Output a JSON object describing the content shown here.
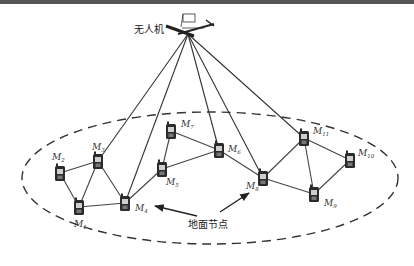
{
  "diagram": {
    "uav": {
      "label": "无人机",
      "x": 188,
      "y": 30
    },
    "ground_label": "地面节点",
    "region": {
      "cx": 210,
      "cy": 178,
      "rx": 188,
      "ry": 66
    },
    "nodes": [
      {
        "id": "M1",
        "sub": "1",
        "x": 79,
        "y": 207,
        "lx": 74,
        "ly": 227
      },
      {
        "id": "M2",
        "sub": "2",
        "x": 60,
        "y": 173,
        "lx": 52,
        "ly": 160
      },
      {
        "id": "M3",
        "sub": "3",
        "x": 98,
        "y": 161,
        "lx": 92,
        "ly": 150
      },
      {
        "id": "M4",
        "sub": "4",
        "x": 125,
        "y": 203,
        "lx": 135,
        "ly": 211
      },
      {
        "id": "M5",
        "sub": "5",
        "x": 162,
        "y": 169,
        "lx": 166,
        "ly": 185
      },
      {
        "id": "M6",
        "sub": "6",
        "x": 219,
        "y": 150,
        "lx": 228,
        "ly": 152
      },
      {
        "id": "M7",
        "sub": "7",
        "x": 171,
        "y": 131,
        "lx": 181,
        "ly": 127
      },
      {
        "id": "M8",
        "sub": "8",
        "x": 263,
        "y": 178,
        "lx": 246,
        "ly": 189
      },
      {
        "id": "M9",
        "sub": "9",
        "x": 314,
        "y": 194,
        "lx": 324,
        "ly": 206
      },
      {
        "id": "M10",
        "sub": "10",
        "x": 350,
        "y": 160,
        "lx": 358,
        "ly": 156
      },
      {
        "id": "M11",
        "sub": "11",
        "x": 304,
        "y": 138,
        "lx": 313,
        "ly": 134
      }
    ],
    "edges": [
      [
        "M2",
        "M3"
      ],
      [
        "M2",
        "M1"
      ],
      [
        "M1",
        "M3"
      ],
      [
        "M1",
        "M4"
      ],
      [
        "M3",
        "M4"
      ],
      [
        "M4",
        "M5"
      ],
      [
        "M5",
        "M7"
      ],
      [
        "M7",
        "M6"
      ],
      [
        "M5",
        "M6"
      ],
      [
        "M6",
        "M8"
      ],
      [
        "M8",
        "M11"
      ],
      [
        "M8",
        "M9"
      ],
      [
        "M11",
        "M9"
      ],
      [
        "M11",
        "M10"
      ],
      [
        "M10",
        "M9"
      ]
    ],
    "uav_links": [
      "M3",
      "M4",
      "M6",
      "M8",
      "M11"
    ],
    "arrows": [
      {
        "from": [
          197,
          216
        ],
        "to": [
          155,
          206
        ]
      },
      {
        "from": [
          220,
          212
        ],
        "to": [
          249,
          193
        ]
      }
    ]
  }
}
